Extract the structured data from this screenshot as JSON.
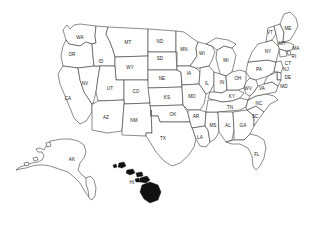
{
  "map": {
    "title": "United States Map with State Abbreviations",
    "background_color": "#ffffff",
    "outline_color": "#2b2b2b",
    "label_color": "#1a1a1a",
    "filled_island_color": "#111111",
    "projection_note": "Alaska and Hawaii shown as insets at lower left and lower center",
    "states": [
      {
        "abbr": "WA",
        "x": 80,
        "y": 38,
        "region": "west"
      },
      {
        "abbr": "OR",
        "x": 72,
        "y": 55,
        "region": "west"
      },
      {
        "abbr": "CA",
        "x": 68,
        "y": 99,
        "region": "west"
      },
      {
        "abbr": "NV",
        "x": 85,
        "y": 84,
        "region": "west"
      },
      {
        "abbr": "ID",
        "x": 101,
        "y": 62,
        "region": "west"
      },
      {
        "abbr": "MT",
        "x": 128,
        "y": 43,
        "region": "west"
      },
      {
        "abbr": "WY",
        "x": 130,
        "y": 68,
        "region": "west"
      },
      {
        "abbr": "UT",
        "x": 110,
        "y": 89,
        "region": "west"
      },
      {
        "abbr": "AZ",
        "x": 106,
        "y": 118,
        "region": "west"
      },
      {
        "abbr": "CO",
        "x": 136,
        "y": 92,
        "region": "west"
      },
      {
        "abbr": "NM",
        "x": 134,
        "y": 121,
        "region": "west"
      },
      {
        "abbr": "ND",
        "x": 160,
        "y": 42,
        "region": "midwest"
      },
      {
        "abbr": "SD",
        "x": 160,
        "y": 59,
        "region": "midwest"
      },
      {
        "abbr": "NE",
        "x": 162,
        "y": 79,
        "region": "midwest"
      },
      {
        "abbr": "KS",
        "x": 167,
        "y": 98,
        "region": "midwest"
      },
      {
        "abbr": "OK",
        "x": 173,
        "y": 115,
        "region": "south"
      },
      {
        "abbr": "TX",
        "x": 163,
        "y": 139,
        "region": "south"
      },
      {
        "abbr": "MN",
        "x": 184,
        "y": 50,
        "region": "midwest"
      },
      {
        "abbr": "IA",
        "x": 189,
        "y": 74,
        "region": "midwest"
      },
      {
        "abbr": "MO",
        "x": 192,
        "y": 97,
        "region": "midwest"
      },
      {
        "abbr": "AR",
        "x": 196,
        "y": 117,
        "region": "south"
      },
      {
        "abbr": "LA",
        "x": 200,
        "y": 138,
        "region": "south"
      },
      {
        "abbr": "WI",
        "x": 202,
        "y": 54,
        "region": "midwest"
      },
      {
        "abbr": "IL",
        "x": 207,
        "y": 84,
        "region": "midwest"
      },
      {
        "abbr": "MS",
        "x": 213,
        "y": 126,
        "region": "south"
      },
      {
        "abbr": "MI",
        "x": 226,
        "y": 61,
        "region": "midwest"
      },
      {
        "abbr": "IN",
        "x": 222,
        "y": 83,
        "region": "midwest"
      },
      {
        "abbr": "KY",
        "x": 232,
        "y": 97,
        "region": "south"
      },
      {
        "abbr": "TN",
        "x": 230,
        "y": 108,
        "region": "south"
      },
      {
        "abbr": "AL",
        "x": 228,
        "y": 126,
        "region": "south"
      },
      {
        "abbr": "OH",
        "x": 238,
        "y": 79,
        "region": "midwest"
      },
      {
        "abbr": "GA",
        "x": 243,
        "y": 126,
        "region": "south"
      },
      {
        "abbr": "FL",
        "x": 257,
        "y": 155,
        "region": "south"
      },
      {
        "abbr": "SC",
        "x": 255,
        "y": 117,
        "region": "south"
      },
      {
        "abbr": "NC",
        "x": 259,
        "y": 104,
        "region": "south"
      },
      {
        "abbr": "WV",
        "x": 248,
        "y": 89,
        "region": "south"
      },
      {
        "abbr": "VA",
        "x": 262,
        "y": 89,
        "region": "south"
      },
      {
        "abbr": "PA",
        "x": 259,
        "y": 70,
        "region": "northeast"
      },
      {
        "abbr": "NY",
        "x": 268,
        "y": 52,
        "region": "northeast"
      },
      {
        "abbr": "VT",
        "x": 270,
        "y": 33,
        "region": "northeast"
      },
      {
        "abbr": "NH",
        "x": 282,
        "y": 44,
        "region": "northeast"
      },
      {
        "abbr": "ME",
        "x": 288,
        "y": 29,
        "region": "northeast"
      },
      {
        "abbr": "MA",
        "x": 296,
        "y": 49,
        "region": "northeast"
      },
      {
        "abbr": "RI",
        "x": 294,
        "y": 57,
        "region": "northeast"
      },
      {
        "abbr": "CT",
        "x": 288,
        "y": 64,
        "region": "northeast"
      },
      {
        "abbr": "NJ",
        "x": 286,
        "y": 70,
        "region": "northeast"
      },
      {
        "abbr": "DE",
        "x": 288,
        "y": 78,
        "region": "northeast"
      },
      {
        "abbr": "MD",
        "x": 284,
        "y": 87,
        "region": "northeast"
      },
      {
        "abbr": "AK",
        "x": 72,
        "y": 160,
        "region": "inset"
      },
      {
        "abbr": "HI",
        "x": 132,
        "y": 183,
        "region": "inset"
      }
    ]
  }
}
